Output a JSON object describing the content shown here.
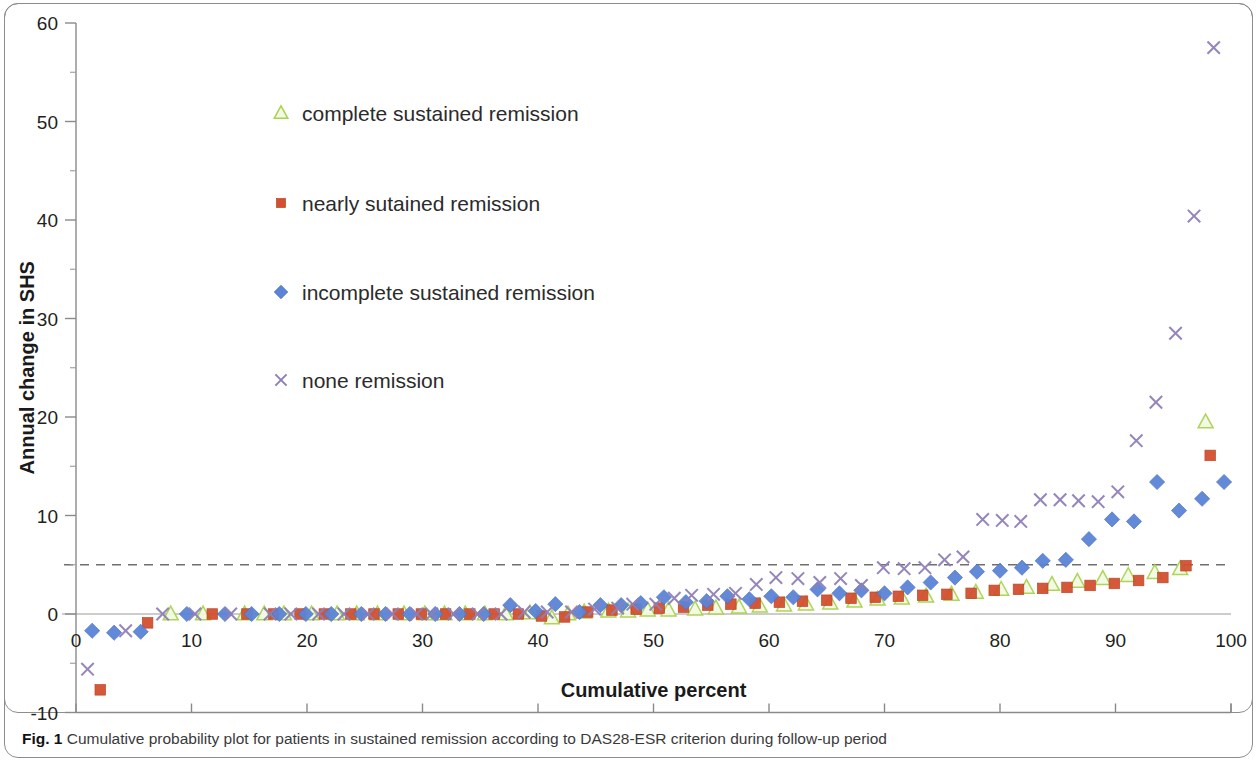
{
  "figure": {
    "caption_label": "Fig. 1",
    "caption_text": "Cumulative probability plot for patients in sustained remission according to DAS28-ESR criterion during follow-up period"
  },
  "legend": {
    "items": [
      {
        "label": "complete sustained remission",
        "marker": "triangle-open-icon",
        "color": "#c6e08a"
      },
      {
        "label": "nearly sutained remission",
        "marker": "square-icon",
        "color": "#d2502f"
      },
      {
        "label": "incomplete sustained remission",
        "marker": "diamond-icon",
        "color": "#5b84d6"
      },
      {
        "label": "none remission",
        "marker": "cross-icon",
        "color": "#8f7fb8"
      }
    ]
  },
  "chart_data": {
    "type": "scatter",
    "title": "",
    "xlabel": "Cumulative percent",
    "ylabel": "Annual change in SHS",
    "xlim": [
      0,
      100
    ],
    "ylim": [
      -10,
      60
    ],
    "xticks": [
      0,
      10,
      20,
      30,
      40,
      50,
      60,
      70,
      80,
      90,
      100
    ],
    "yticks": [
      -10,
      0,
      10,
      20,
      30,
      40,
      50,
      60
    ],
    "minor_tick_step": 5,
    "grid": false,
    "legend_position": "upper-left-inside",
    "reference_lines": [
      {
        "axis": "y",
        "value": 5,
        "style": "dashed",
        "color": "#6f6f6f"
      },
      {
        "axis": "y",
        "value": 0,
        "style": "solid",
        "color": "#9a9a9a"
      }
    ],
    "series": [
      {
        "name": "complete sustained remission",
        "marker": "triangle-open",
        "color": "#c6e08a",
        "points": [
          [
            8.2,
            0.0
          ],
          [
            11.0,
            0.0
          ],
          [
            14.6,
            0.0
          ],
          [
            16.3,
            0.0
          ],
          [
            18.0,
            0.0
          ],
          [
            20.4,
            0.0
          ],
          [
            22.6,
            0.0
          ],
          [
            24.3,
            0.0
          ],
          [
            26.1,
            0.0
          ],
          [
            28.4,
            0.0
          ],
          [
            30.2,
            0.0
          ],
          [
            31.9,
            0.0
          ],
          [
            33.7,
            0.0
          ],
          [
            35.4,
            0.0
          ],
          [
            37.2,
            0.0
          ],
          [
            39.3,
            0.1
          ],
          [
            41.2,
            -0.4
          ],
          [
            42.6,
            0.0
          ],
          [
            44.0,
            0.2
          ],
          [
            46.1,
            0.3
          ],
          [
            47.8,
            0.3
          ],
          [
            49.5,
            0.4
          ],
          [
            51.3,
            0.4
          ],
          [
            53.6,
            0.5
          ],
          [
            55.4,
            0.6
          ],
          [
            57.4,
            0.7
          ],
          [
            59.2,
            0.8
          ],
          [
            61.3,
            0.9
          ],
          [
            63.2,
            1.0
          ],
          [
            65.3,
            1.1
          ],
          [
            67.4,
            1.3
          ],
          [
            69.4,
            1.5
          ],
          [
            71.5,
            1.6
          ],
          [
            73.6,
            1.8
          ],
          [
            75.8,
            2.0
          ],
          [
            77.9,
            2.2
          ],
          [
            80.1,
            2.5
          ],
          [
            82.3,
            2.7
          ],
          [
            84.5,
            3.0
          ],
          [
            86.7,
            3.3
          ],
          [
            88.9,
            3.6
          ],
          [
            91.1,
            3.9
          ],
          [
            93.4,
            4.2
          ],
          [
            95.6,
            4.6
          ],
          [
            97.8,
            19.5
          ]
        ]
      },
      {
        "name": "nearly sutained remission",
        "marker": "square",
        "color": "#d2502f",
        "points": [
          [
            2.1,
            -7.7
          ],
          [
            6.2,
            -0.9
          ],
          [
            11.8,
            0.0
          ],
          [
            14.8,
            0.0
          ],
          [
            17.1,
            0.0
          ],
          [
            19.4,
            0.0
          ],
          [
            21.5,
            0.0
          ],
          [
            23.8,
            0.0
          ],
          [
            25.8,
            0.0
          ],
          [
            27.9,
            0.0
          ],
          [
            29.9,
            0.0
          ],
          [
            32.0,
            0.0
          ],
          [
            34.1,
            0.0
          ],
          [
            36.2,
            0.0
          ],
          [
            38.3,
            0.0
          ],
          [
            40.3,
            -0.2
          ],
          [
            42.3,
            -0.3
          ],
          [
            44.3,
            0.2
          ],
          [
            46.4,
            0.4
          ],
          [
            48.5,
            0.5
          ],
          [
            50.5,
            0.6
          ],
          [
            52.6,
            0.7
          ],
          [
            54.7,
            0.9
          ],
          [
            56.7,
            1.0
          ],
          [
            58.8,
            1.1
          ],
          [
            60.9,
            1.2
          ],
          [
            62.9,
            1.3
          ],
          [
            65.0,
            1.4
          ],
          [
            67.1,
            1.6
          ],
          [
            69.2,
            1.7
          ],
          [
            71.2,
            1.8
          ],
          [
            73.3,
            1.9
          ],
          [
            75.4,
            2.0
          ],
          [
            77.5,
            2.1
          ],
          [
            79.5,
            2.4
          ],
          [
            81.6,
            2.5
          ],
          [
            83.7,
            2.6
          ],
          [
            85.8,
            2.7
          ],
          [
            87.8,
            2.9
          ],
          [
            89.9,
            3.1
          ],
          [
            92.0,
            3.4
          ],
          [
            94.1,
            3.7
          ],
          [
            96.1,
            4.9
          ],
          [
            98.2,
            16.1
          ]
        ]
      },
      {
        "name": "incomplete sustained remission",
        "marker": "diamond",
        "color": "#5b84d6",
        "points": [
          [
            1.4,
            -1.7
          ],
          [
            3.3,
            -1.9
          ],
          [
            5.6,
            -1.8
          ],
          [
            9.6,
            0.0
          ],
          [
            12.9,
            0.0
          ],
          [
            15.2,
            0.0
          ],
          [
            17.6,
            0.0
          ],
          [
            19.9,
            0.0
          ],
          [
            22.1,
            0.0
          ],
          [
            24.7,
            0.0
          ],
          [
            26.8,
            0.0
          ],
          [
            28.9,
            0.0
          ],
          [
            31.1,
            0.0
          ],
          [
            33.2,
            0.0
          ],
          [
            35.3,
            0.0
          ],
          [
            37.6,
            0.9
          ],
          [
            39.8,
            0.3
          ],
          [
            41.5,
            1.0
          ],
          [
            43.6,
            0.2
          ],
          [
            45.4,
            0.9
          ],
          [
            47.2,
            0.9
          ],
          [
            48.9,
            1.1
          ],
          [
            50.9,
            1.7
          ],
          [
            52.8,
            1.2
          ],
          [
            54.6,
            1.3
          ],
          [
            56.4,
            1.8
          ],
          [
            58.3,
            1.5
          ],
          [
            60.2,
            1.8
          ],
          [
            62.1,
            1.7
          ],
          [
            64.2,
            2.5
          ],
          [
            66.1,
            2.1
          ],
          [
            68.0,
            2.4
          ],
          [
            70.0,
            2.1
          ],
          [
            72.0,
            2.7
          ],
          [
            74.0,
            3.2
          ],
          [
            76.1,
            3.7
          ],
          [
            78.0,
            4.3
          ],
          [
            80.0,
            4.4
          ],
          [
            81.9,
            4.7
          ],
          [
            83.7,
            5.4
          ],
          [
            85.7,
            5.5
          ],
          [
            87.7,
            7.6
          ],
          [
            89.7,
            9.6
          ],
          [
            91.6,
            9.4
          ],
          [
            93.6,
            13.4
          ],
          [
            95.5,
            10.5
          ],
          [
            97.5,
            11.7
          ],
          [
            99.4,
            13.4
          ]
        ]
      },
      {
        "name": "none remission",
        "marker": "cross",
        "color": "#8f7fb8",
        "points": [
          [
            1.0,
            -5.6
          ],
          [
            4.3,
            -1.7
          ],
          [
            7.5,
            0.0
          ],
          [
            10.3,
            0.0
          ],
          [
            13.4,
            0.0
          ],
          [
            16.8,
            0.0
          ],
          [
            18.6,
            0.0
          ],
          [
            21.0,
            0.0
          ],
          [
            23.2,
            0.0
          ],
          [
            25.3,
            0.0
          ],
          [
            27.4,
            0.0
          ],
          [
            29.5,
            0.0
          ],
          [
            30.8,
            0.0
          ],
          [
            32.7,
            0.0
          ],
          [
            34.8,
            0.0
          ],
          [
            36.8,
            0.0
          ],
          [
            38.8,
            0.2
          ],
          [
            40.8,
            0.2
          ],
          [
            42.9,
            0.2
          ],
          [
            44.9,
            0.5
          ],
          [
            46.9,
            0.6
          ],
          [
            48.2,
            1.0
          ],
          [
            50.2,
            1.0
          ],
          [
            51.8,
            1.6
          ],
          [
            53.3,
            1.9
          ],
          [
            55.2,
            2.0
          ],
          [
            57.1,
            2.1
          ],
          [
            58.9,
            3.0
          ],
          [
            60.6,
            3.7
          ],
          [
            62.5,
            3.6
          ],
          [
            64.4,
            3.2
          ],
          [
            66.2,
            3.6
          ],
          [
            68.0,
            2.9
          ],
          [
            69.9,
            4.7
          ],
          [
            71.7,
            4.6
          ],
          [
            73.5,
            4.7
          ],
          [
            75.2,
            5.5
          ],
          [
            76.8,
            5.8
          ],
          [
            78.5,
            9.6
          ],
          [
            80.2,
            9.5
          ],
          [
            81.8,
            9.4
          ],
          [
            83.5,
            11.6
          ],
          [
            85.2,
            11.6
          ],
          [
            86.8,
            11.5
          ],
          [
            88.5,
            11.4
          ],
          [
            90.2,
            12.4
          ],
          [
            91.8,
            17.6
          ],
          [
            93.5,
            21.5
          ],
          [
            95.2,
            28.5
          ],
          [
            96.8,
            40.4
          ],
          [
            98.5,
            57.5
          ]
        ]
      }
    ]
  }
}
